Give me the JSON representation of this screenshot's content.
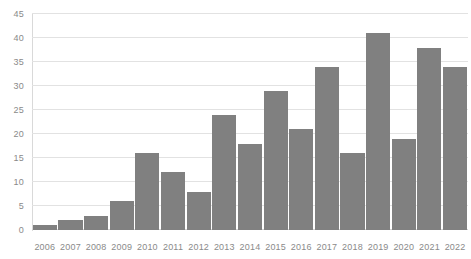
{
  "chart_data": {
    "type": "bar",
    "title": "",
    "subtitle": "",
    "xlabel": "",
    "ylabel": "",
    "categories": [
      "2006",
      "2007",
      "2008",
      "2009",
      "2010",
      "2011",
      "2012",
      "2013",
      "2014",
      "2015",
      "2016",
      "2017",
      "2018",
      "2019",
      "2020",
      "2021",
      "2022"
    ],
    "values": [
      1,
      2,
      3,
      6,
      16,
      12,
      8,
      24,
      18,
      29,
      21,
      34,
      16,
      41,
      19,
      38,
      34
    ],
    "ylim": [
      0,
      45
    ],
    "y_ticks": [
      0,
      5,
      10,
      15,
      20,
      25,
      30,
      35,
      40,
      45
    ],
    "y_tick_labels": [
      "0",
      "5",
      "10",
      "15",
      "20",
      "25",
      "30",
      "35",
      "40",
      "45"
    ],
    "grid": true,
    "grid_axis": "y",
    "legend": false,
    "legend_position": "none",
    "series": [
      {
        "name": "",
        "values": [
          1,
          2,
          3,
          6,
          16,
          12,
          8,
          24,
          18,
          29,
          21,
          34,
          16,
          41,
          19,
          38,
          34
        ]
      }
    ],
    "colors": {
      "bar": "#808080",
      "gridline": "#e2e2e2",
      "axis_line": "#d9d9d9",
      "tick_label": "#8a8a8a",
      "background": "#ffffff"
    }
  }
}
